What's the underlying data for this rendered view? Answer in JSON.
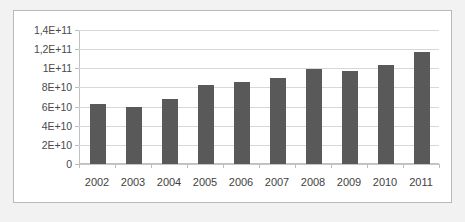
{
  "chart_data": {
    "type": "bar",
    "title": "",
    "subtitle": "",
    "xlabel": "",
    "ylabel": "",
    "categories": [
      "2002",
      "2003",
      "2004",
      "2005",
      "2006",
      "2007",
      "2008",
      "2009",
      "2010",
      "2011"
    ],
    "values": [
      63000000000,
      60000000000,
      68000000000,
      83000000000,
      86000000000,
      90000000000,
      99000000000,
      97000000000,
      103000000000,
      117000000000
    ],
    "series": [
      {
        "name": "",
        "values": [
          63000000000,
          60000000000,
          68000000000,
          83000000000,
          86000000000,
          90000000000,
          99000000000,
          97000000000,
          103000000000,
          117000000000
        ]
      }
    ],
    "ylim": [
      0,
      140000000000
    ],
    "ytick_values": [
      0,
      20000000000,
      40000000000,
      60000000000,
      80000000000,
      100000000000,
      120000000000,
      140000000000
    ],
    "ytick_labels": [
      "0",
      "2E+10",
      "4E+10",
      "6E+10",
      "8E+10",
      "1E+11",
      "1,2E+11",
      "1,4E+11"
    ],
    "grid": true,
    "grid_axis": "y",
    "legend": false,
    "legend_position": "none",
    "bar_color": "#595959",
    "gridline_color": "#d8d8d8",
    "axis_color": "#c0c0c0",
    "plot_background": "#ffffff",
    "figure_background": "#f2f2f2",
    "annotations": []
  }
}
